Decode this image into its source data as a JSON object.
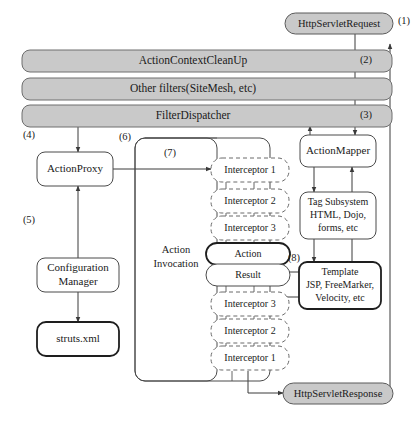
{
  "diagram": {
    "colors": {
      "bar_fill": "#c9c9c9",
      "pill_fill": "#c9c9c9",
      "box_fill": "#ffffff",
      "stroke": "#4a4a4a",
      "stroke_bold": "#1e1e1e",
      "text": "#1a1a1a",
      "background": "#ffffff"
    },
    "steps": {
      "s1": "(1)",
      "s2": "(2)",
      "s3": "(3)",
      "s4": "(4)",
      "s5": "(5)",
      "s6": "(6)",
      "s7": "(7)",
      "s8": "(8)"
    },
    "pills": {
      "request": "HttpServletRequest",
      "response": "HttpServletResponse"
    },
    "filter_bars": [
      {
        "label": "ActionContextCleanUp"
      },
      {
        "label": "Other filters(SiteMesh, etc)"
      },
      {
        "label": "FilterDispatcher"
      }
    ],
    "left_column": {
      "action_proxy": "ActionProxy",
      "configuration_manager_line1": "Configuration",
      "configuration_manager_line2": "Manager",
      "struts_xml": "struts.xml"
    },
    "action_invocation": {
      "label_line1": "Action",
      "label_line2": "Invocation",
      "interceptors_in": [
        "Interceptor 1",
        "Interceptor 2",
        "Interceptor 3"
      ],
      "action": "Action",
      "result": "Result",
      "interceptors_out": [
        "Interceptor 3",
        "Interceptor 2",
        "Interceptor 1"
      ]
    },
    "right_column": {
      "action_mapper": "ActionMapper",
      "tag_subsystem_line1": "Tag Subsystem",
      "tag_subsystem_line2": "HTML, Dojo,",
      "tag_subsystem_line3": "forms, etc",
      "template_line1": "Template",
      "template_line2": "JSP, FreeMarker,",
      "template_line3": "Velocity, etc"
    }
  }
}
